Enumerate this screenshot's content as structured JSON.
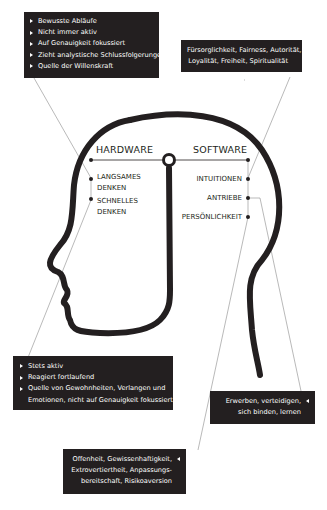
{
  "diagram": {
    "headings": {
      "hardware": "HARDWARE",
      "software": "SOFTWARE"
    },
    "hardware_items": [
      {
        "label_line1": "LANGSAMES",
        "label_line2": "DENKEN"
      },
      {
        "label_line1": "SCHNELLES",
        "label_line2": "DENKEN"
      }
    ],
    "software_items": [
      {
        "label": "INTUITIONEN"
      },
      {
        "label": "ANTRIEBE"
      },
      {
        "label": "PERSÖNLICHKEIT"
      }
    ],
    "boxes": {
      "slow_thinking": {
        "items": [
          "Bewusste Abläufe",
          "Nicht immer aktiv",
          "Auf Genauigkeit fokussiert",
          "Zieht analystische Schlussfolgerungen",
          "Quelle der Willenskraft"
        ]
      },
      "intuitions": {
        "line1": "Fürsorglichkeit, Fairness, Autorität,",
        "line2": "Loyalität, Freiheit, Spiritualität"
      },
      "fast_thinking": {
        "items": [
          "Stets aktiv",
          "Reagiert fortlaufend",
          "Quelle von Gewohnheiten, Verlangen und",
          "Emotionen, nicht auf Genauigkeit fokussiert"
        ]
      },
      "drives": {
        "line1": "Erwerben, verteidigen,",
        "line2": "sich binden, lernen"
      },
      "personality": {
        "line1": "Offenheit, Gewissenhaftigkeit,",
        "line2": "Extrovertiertheit, Anpassungs-",
        "line3": "bereitschaft, Risikoaversion"
      }
    },
    "colors": {
      "ink": "#231f20",
      "box_bg": "#231f20",
      "box_text": "#ffffff",
      "connector": "#8a8a8a"
    }
  }
}
